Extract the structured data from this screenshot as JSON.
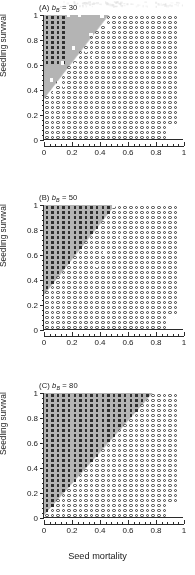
{
  "figure": {
    "axis_titles": {
      "x": "Seed mortality",
      "y": "Seedling survival"
    },
    "x_ticks": [
      "0",
      "0.2",
      "0.4",
      "0.6",
      "0.8",
      "1"
    ],
    "y_ticks": [
      "0",
      "0.2",
      "0.4",
      "0.6",
      "0.8",
      "1"
    ],
    "colors": {
      "gray_region": "#b4b4b4",
      "marker_filled": "#2f2f2f",
      "marker_open": "#3a3a3a",
      "marker_white": "#fdfdfd",
      "axis": "#2b2b2b",
      "background": "#ffffff"
    },
    "panels": [
      {
        "id": "A",
        "tag": "(A)",
        "param": "b",
        "param_sub": "B",
        "eq": "=",
        "value": "30",
        "label": "(A) bB = 30"
      },
      {
        "id": "B",
        "tag": "(B)",
        "param": "b",
        "param_sub": "B",
        "eq": "=",
        "value": "50",
        "label": "(B) bB = 50"
      },
      {
        "id": "C",
        "tag": "(C)",
        "param": "b",
        "param_sub": "B",
        "eq": "=",
        "value": "80",
        "label": "(C) bB = 80"
      }
    ]
  },
  "chart_data": [
    {
      "type": "scatter",
      "panel": "A",
      "title": "(A) bB = 30",
      "xlabel": "Seed mortality",
      "ylabel": "Seedling survival",
      "xlim": [
        0,
        1
      ],
      "ylim": [
        0,
        1
      ],
      "grid": false,
      "legend_position": "none",
      "series": [
        {
          "name": "filled-square",
          "symbol": "filled square",
          "description": "outcome region at low seed mortality and high seedling survival",
          "x_range": [
            0.0,
            0.16
          ],
          "y_range": [
            0.62,
            1.0
          ],
          "count": 42
        },
        {
          "name": "open-circle",
          "symbol": "open circle",
          "description": "outcome region at high seed mortality / low seedling survival",
          "x_range": [
            0.0,
            0.96
          ],
          "y_range": [
            0.02,
            1.0
          ],
          "count": 430
        },
        {
          "name": "white-square",
          "symbol": "white square",
          "description": "scattered transitional points along the diagonal boundary",
          "x_range": [
            0.04,
            0.48
          ],
          "y_range": [
            0.36,
            1.0
          ],
          "count": 14
        }
      ],
      "shaded_region": {
        "name": "gray-region",
        "description": "upper-left triangular shaded area above the diagonal boundary",
        "color": "#b4b4b4"
      }
    },
    {
      "type": "scatter",
      "panel": "B",
      "title": "(B) bB = 50",
      "xlabel": "Seed mortality",
      "ylabel": "Seedling survival",
      "xlim": [
        0,
        1
      ],
      "ylim": [
        0,
        1
      ],
      "grid": false,
      "legend_position": "none",
      "series": [
        {
          "name": "filled-square",
          "symbol": "filled square",
          "description": "expanded outcome region reaching the diagonal boundary",
          "x_range": [
            0.0,
            0.52
          ],
          "y_range": [
            0.3,
            1.0
          ],
          "count": 230
        },
        {
          "name": "open-circle",
          "symbol": "open circle",
          "description": "outcome region at high seed mortality / low seedling survival",
          "x_range": [
            0.0,
            0.96
          ],
          "y_range": [
            0.02,
            1.0
          ],
          "count": 380
        },
        {
          "name": "white-square",
          "symbol": "white square",
          "description": "scattered transitional points along the diagonal boundary",
          "x_range": [
            0.36,
            0.56
          ],
          "y_range": [
            0.5,
            0.74
          ],
          "count": 4
        }
      ],
      "shaded_region": {
        "name": "gray-region",
        "description": "upper-left triangular shaded area above the diagonal boundary",
        "color": "#b4b4b4"
      }
    },
    {
      "type": "scatter",
      "panel": "C",
      "title": "(C) bB = 80",
      "xlabel": "Seed mortality",
      "ylabel": "Seedling survival",
      "xlim": [
        0,
        1
      ],
      "ylim": [
        0,
        1
      ],
      "grid": false,
      "legend_position": "none",
      "series": [
        {
          "name": "filled-square",
          "symbol": "filled square",
          "description": "outcome region covering most of the plot up to the diagonal boundary",
          "x_range": [
            0.0,
            0.8
          ],
          "y_range": [
            0.02,
            1.0
          ],
          "count": 470
        },
        {
          "name": "open-circle",
          "symbol": "open circle",
          "description": "outcome region confined to the far right / lower right corner",
          "x_range": [
            0.3,
            0.96
          ],
          "y_range": [
            0.02,
            1.0
          ],
          "count": 210
        },
        {
          "name": "white-square",
          "symbol": "white square",
          "description": "no isolated white squares present",
          "x_range": [
            0,
            0
          ],
          "y_range": [
            0,
            0
          ],
          "count": 0
        }
      ],
      "shaded_region": {
        "name": "gray-region",
        "description": "upper-left shaded area above the diagonal boundary",
        "color": "#b4b4b4"
      }
    }
  ]
}
